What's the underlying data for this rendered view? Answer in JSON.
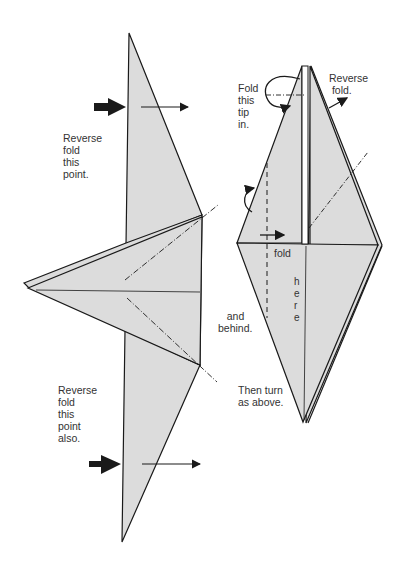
{
  "colors": {
    "paper": "#dcdcdc",
    "line": "#1a1a1a",
    "text": "#333333",
    "background": "#ffffff"
  },
  "left_figure": {
    "top_instruction": "Reverse\nfold\nthis\npoint.",
    "bottom_instruction": "Reverse\nfold\nthis\npoint\nalso."
  },
  "right_figure": {
    "tip_instruction": "Fold\nthis\ntip\nin.",
    "reverse_fold_label": "Reverse\n fold.",
    "fold_label": "fold",
    "here_label": "h\ne\nr\ne",
    "behind_label": "   and\nbehind.",
    "turn_instruction": "Then turn\nas above."
  }
}
